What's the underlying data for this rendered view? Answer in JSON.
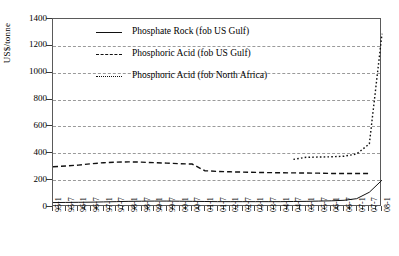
{
  "chart_data": {
    "type": "line",
    "title": "",
    "xlabel": "",
    "ylabel": "US$/tonne",
    "ylim": [
      0,
      1400
    ],
    "yticks": [
      0,
      200,
      400,
      600,
      800,
      1000,
      1200,
      1400
    ],
    "grid": true,
    "legend_position": "top-center-inside",
    "x": [
      "95-1",
      "95-7",
      "96-1",
      "96-7",
      "97-1",
      "97-7",
      "98-1",
      "98-7",
      "99-1",
      "99-7",
      "00-1",
      "00-7",
      "01-1",
      "01-7",
      "02-1",
      "02-7",
      "03-1",
      "03-7",
      "04-1",
      "04-7",
      "05-1",
      "05-7",
      "06-1",
      "06-7",
      "07-1",
      "07-7",
      "08-1"
    ],
    "series": [
      {
        "name": "Phosphate Rock (fob US Gulf)",
        "style": "solid",
        "color": "#111111",
        "values": [
          33,
          34,
          35,
          36,
          38,
          40,
          42,
          43,
          44,
          44,
          43,
          42,
          41,
          40,
          40,
          40,
          40,
          40,
          40,
          41,
          42,
          44,
          46,
          50,
          62,
          110,
          200
        ]
      },
      {
        "name": "Phosphoric Acid (fob US Gulf)",
        "style": "dash-dot",
        "color": "#111111",
        "values": [
          300,
          305,
          312,
          322,
          330,
          334,
          336,
          334,
          330,
          327,
          322,
          320,
          270,
          265,
          262,
          260,
          258,
          256,
          255,
          254,
          253,
          252,
          250,
          250,
          250,
          250,
          null
        ]
      },
      {
        "name": "Phosphoric Acid (fob North Africa)",
        "style": "dotted",
        "color": "#111111",
        "values": [
          null,
          null,
          null,
          null,
          null,
          null,
          null,
          null,
          null,
          null,
          null,
          null,
          null,
          null,
          null,
          null,
          null,
          null,
          null,
          355,
          370,
          372,
          374,
          378,
          395,
          470,
          1290
        ]
      }
    ]
  },
  "legend": {
    "items": [
      {
        "label": "Phosphate Rock (fob US Gulf)",
        "style": "solid"
      },
      {
        "label": "Phosphoric Acid (fob US Gulf)",
        "style": "dashdot"
      },
      {
        "label": "Phosphoric Acid (fob North Africa)",
        "style": "dotted"
      }
    ]
  }
}
